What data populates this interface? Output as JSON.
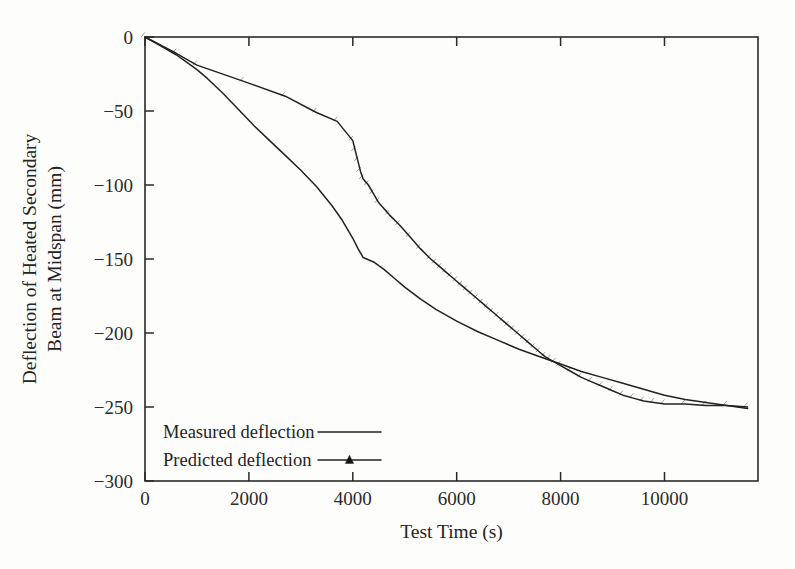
{
  "chart_data": {
    "type": "line",
    "title": "",
    "xlabel": "Test Time (s)",
    "ylabel": "Deflection of Heated Secondary Beam at Midspan (mm)",
    "ylabel_line1": "Deflection of Heated Secondary",
    "ylabel_line2": "Beam at Midspan (mm)",
    "xlim": [
      0,
      11800
    ],
    "ylim": [
      -300,
      0
    ],
    "xticks": [
      0,
      2000,
      4000,
      6000,
      8000,
      10000
    ],
    "xtick_labels": [
      "0",
      "2000",
      "4000",
      "6000",
      "8000",
      "10000"
    ],
    "yticks": [
      0,
      -50,
      -100,
      -150,
      -200,
      -250,
      -300
    ],
    "ytick_labels": [
      "0",
      "-50",
      "-100",
      "-150",
      "-200",
      "-250",
      "-300"
    ],
    "grid": false,
    "legend_position": "lower-left-inside",
    "line_color": "#222222",
    "marker_color": "#151515",
    "series": [
      {
        "name": "Measured deflection",
        "marker": "none",
        "x": [
          0,
          200,
          400,
          600,
          800,
          1000,
          1200,
          1500,
          1800,
          2100,
          2400,
          2700,
          3000,
          3300,
          3600,
          3800,
          4000,
          4100,
          4200,
          4400,
          4600,
          4800,
          5000,
          5300,
          5600,
          6000,
          6400,
          6800,
          7200,
          7600,
          8000,
          8400,
          8800,
          9200,
          9600,
          10000,
          10400,
          10800,
          11200,
          11600
        ],
        "y": [
          0,
          -4,
          -8,
          -12,
          -17,
          -22,
          -28,
          -38,
          -49,
          -60,
          -70,
          -80,
          -90,
          -101,
          -114,
          -124,
          -136,
          -143,
          -149,
          -152,
          -157,
          -163,
          -169,
          -177,
          -184,
          -192,
          -199,
          -205,
          -211,
          -216,
          -221,
          -226,
          -230,
          -234,
          -238,
          -242,
          -245,
          -247,
          -249,
          -251
        ]
      },
      {
        "name": "Predicted deflection",
        "marker": "triangle",
        "x": [
          0,
          600,
          1000,
          1900,
          2700,
          3300,
          3700,
          4000,
          4050,
          4100,
          4150,
          4200,
          4300,
          4400,
          4500,
          4700,
          4900,
          5100,
          5300,
          5500,
          5600,
          5700,
          5800,
          5900,
          6000,
          6100,
          6200,
          6300,
          6400,
          6500,
          6600,
          6700,
          6800,
          6900,
          7000,
          7100,
          7200,
          7300,
          7400,
          7500,
          7600,
          7700,
          7800,
          7900,
          8000,
          8200,
          8400,
          8600,
          8800,
          9000,
          9200,
          9400,
          9600,
          9800,
          10000,
          10400,
          10800,
          11200,
          11600
        ],
        "y": [
          0,
          -11,
          -19,
          -30,
          -40,
          -51,
          -57,
          -70,
          -77,
          -84,
          -91,
          -96,
          -100,
          -106,
          -112,
          -120,
          -127,
          -135,
          -143,
          -150,
          -153,
          -156,
          -159,
          -162,
          -165,
          -168,
          -171,
          -174,
          -177,
          -180,
          -183,
          -186,
          -189,
          -192,
          -195,
          -198,
          -201,
          -204,
          -207,
          -210,
          -213,
          -216,
          -218,
          -220,
          -222,
          -226,
          -230,
          -233,
          -236,
          -239,
          -242,
          -244,
          -246,
          -247,
          -248,
          -248,
          -249,
          -249,
          -250
        ]
      }
    ],
    "legend": [
      {
        "label": "Measured deflection",
        "marker": "none"
      },
      {
        "label": "Predicted deflection",
        "marker": "triangle"
      }
    ]
  }
}
